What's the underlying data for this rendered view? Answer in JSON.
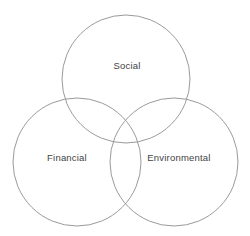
{
  "diagram": {
    "type": "venn-3-circle",
    "canvas": {
      "width": 250,
      "height": 236
    },
    "background_color": "#ffffff",
    "stroke_color": "#9a9a9a",
    "stroke_width": 1,
    "label_color": "#434343",
    "sets": [
      {
        "id": "social",
        "label": "Social",
        "cx": 126,
        "cy": 79,
        "r": 64,
        "label_x": 127,
        "label_y": 66
      },
      {
        "id": "financial",
        "label": "Financial",
        "cx": 77,
        "cy": 162,
        "r": 64,
        "label_x": 67,
        "label_y": 158
      },
      {
        "id": "environmental",
        "label": "Environmental",
        "cx": 174,
        "cy": 162,
        "r": 64,
        "label_x": 179,
        "label_y": 158
      }
    ]
  }
}
